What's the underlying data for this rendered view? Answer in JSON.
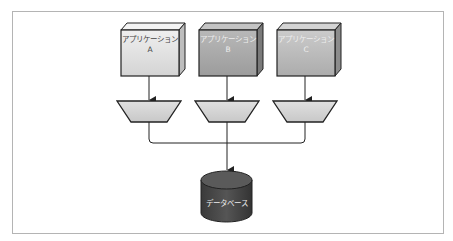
{
  "diagram": {
    "applications": [
      {
        "label": "アプリケーション",
        "letter": "A",
        "color": "#e2e2e2"
      },
      {
        "label": "アプリケーション",
        "letter": "B",
        "color": "#a9a9a9"
      },
      {
        "label": "アプリケーション",
        "letter": "C",
        "color": "#bdbdbd"
      }
    ],
    "database": {
      "label": "データベース",
      "color": "#444444"
    },
    "colors": {
      "frame": "#b4b4b4",
      "line": "#222222",
      "trapezoid": "#d6d6d6",
      "text_dark": "#444444",
      "text_light": "#eeeeee"
    }
  }
}
